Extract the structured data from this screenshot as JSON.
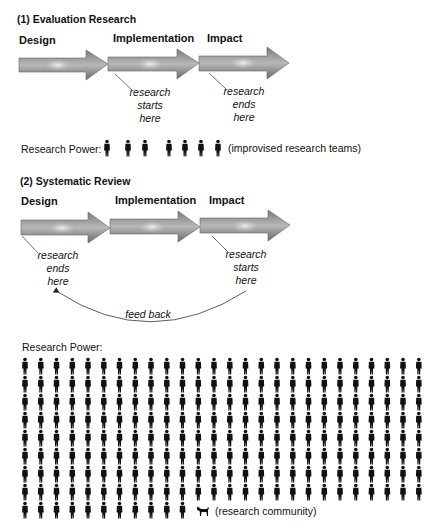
{
  "section1": {
    "title": "(1) Evaluation Research",
    "stages": [
      "Design",
      "Implementation",
      "Impact"
    ],
    "note_start": [
      "research",
      "starts",
      "here"
    ],
    "note_end": [
      "research",
      "ends",
      "here"
    ],
    "power_label": "Research Power:",
    "power_count": 7,
    "power_caption": "(improvised research teams)"
  },
  "section2": {
    "title": "(2) Systematic Review",
    "stages": [
      "Design",
      "Implementation",
      "Impact"
    ],
    "note_end": [
      "research",
      "ends",
      "here"
    ],
    "note_start": [
      "research",
      "starts",
      "here"
    ],
    "feedback_label": "feed back",
    "power_label": "Research Power:",
    "grid_columns": 26,
    "grid_full_rows": 8,
    "grid_last_row_count": 11,
    "extra_icon": "dog-icon",
    "power_caption": "(research community)"
  },
  "colors": {
    "arrow_dark": "#6e6e6e",
    "arrow_mid": "#9a9a9a",
    "arrow_light": "#ececec",
    "figure": "#111111",
    "line": "#333333"
  }
}
